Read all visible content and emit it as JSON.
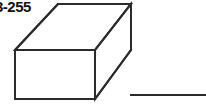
{
  "figure": {
    "problem_label": "3-255",
    "line_color": "#2b2b2b",
    "fill_color": "#ffffff",
    "background_color": "#ffffff",
    "stroke_width": 2
  },
  "shape": {
    "name": "rectangular-prism",
    "type": "cuboid",
    "vertices": {
      "front_top_left": [
        15,
        50
      ],
      "front_top_right": [
        95,
        50
      ],
      "front_bottom_left": [
        15,
        99
      ],
      "front_bottom_right": [
        95,
        99
      ],
      "back_top_left": [
        58,
        4
      ],
      "back_top_right": [
        131,
        4
      ],
      "back_bottom_right": [
        131,
        50
      ]
    },
    "visible_edges": [
      "front-face-rectangle",
      "top-face-parallelogram",
      "right-face-parallelogram"
    ],
    "hidden_edges": "none"
  },
  "answer_line": {
    "name": "answer-blank",
    "x1": 130,
    "y1": 95,
    "x2": 206,
    "y2": 95,
    "text": ""
  }
}
